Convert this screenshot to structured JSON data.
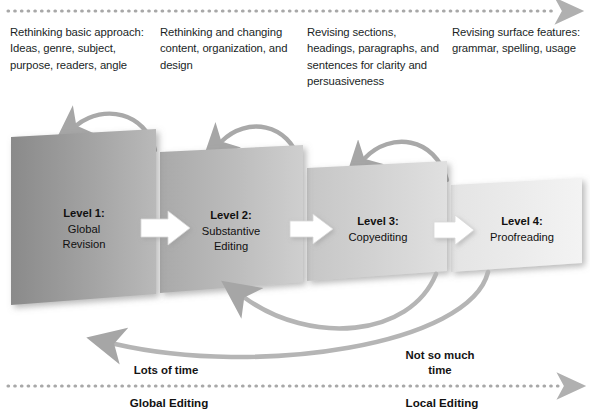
{
  "diagram": {
    "colors": {
      "arrow_gray": "#a6a6a6",
      "dotted_gray": "#a8a8a8",
      "text_dark": "#211f1f",
      "box_dark": "#8d8d8d",
      "box_light": "#efefef"
    },
    "top_axis": {
      "name": "global-to-local-progress-arrow",
      "style": "dotted-arrow-right"
    },
    "columns": [
      {
        "id": "col-1",
        "text": "Rethinking basic approach: Ideas, genre, subject, purpose, readers, angle"
      },
      {
        "id": "col-2",
        "text": "Rethinking and changing content, organization, and design"
      },
      {
        "id": "col-3",
        "text": "Revising sections, headings, paragraphs, and sentences for clarity and persuasiveness"
      },
      {
        "id": "col-4",
        "text": "Revising surface features: grammar, spelling, usage"
      }
    ],
    "levels": [
      {
        "id": "level-1",
        "heading": "Level 1:",
        "line1": "Global",
        "line2": "Revision"
      },
      {
        "id": "level-2",
        "heading": "Level 2:",
        "line1": "Substantive",
        "line2": "Editing"
      },
      {
        "id": "level-3",
        "heading": "Level 3:",
        "line1": "Copyediting",
        "line2": ""
      },
      {
        "id": "level-4",
        "heading": "Level 4:",
        "line1": "Proofreading",
        "line2": ""
      }
    ],
    "time_labels": [
      {
        "id": "time-left",
        "line1": "Lots of time",
        "line2": ""
      },
      {
        "id": "time-right",
        "line1": "Not so much",
        "line2": "time"
      }
    ],
    "bottom_axis": {
      "name": "editing-scope-axis",
      "style": "dotted-arrow-right",
      "left_label": "Global Editing",
      "right_label": "Local Editing"
    },
    "flow_arrows": {
      "forward_count": 3,
      "backward_top_count": 3,
      "backward_bottom_count": 2
    }
  }
}
